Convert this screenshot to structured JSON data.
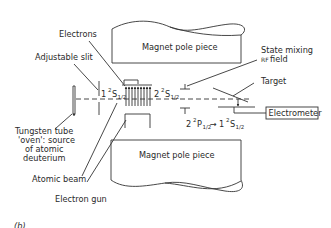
{
  "diagram": {
    "panel_label": "(b)",
    "components": {
      "upper_magnet": "Magnet pole piece",
      "lower_magnet": "Magnet pole piece",
      "electrometer": "Electrometer"
    },
    "callouts": {
      "electrons": "Electrons",
      "adjustable_slit": "Adjustable slit",
      "state_mixing_line1": "State mixing",
      "state_mixing_line2": "RF field",
      "target": "Target",
      "oven_line1": "Tungsten tube",
      "oven_line2": "'oven': source",
      "oven_line3": "of atomic",
      "oven_line4": "deuterium",
      "atomic_beam": "Atomic beam",
      "electron_gun": "Electron gun"
    },
    "states": {
      "s1_n": "1",
      "s1_term": "2",
      "s1_letter": "S",
      "s1_sub": "1/2",
      "s2_n": "2",
      "s2_term": "2",
      "s2_letter": "S",
      "s2_sub": "1/2",
      "transition_from_n": "2",
      "transition_from_term": "2",
      "transition_from_letter": "P",
      "transition_from_sub": "1/2",
      "transition_arrow": "→",
      "transition_to_n": "1",
      "transition_to_term": "2",
      "transition_to_letter": "S",
      "transition_to_sub": "1/2"
    }
  }
}
